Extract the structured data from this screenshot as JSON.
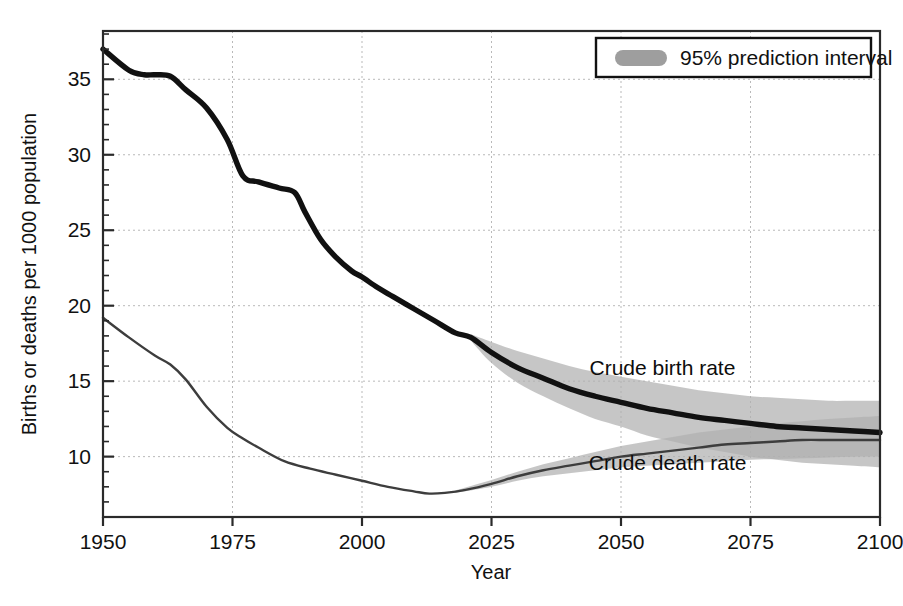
{
  "chart_data": {
    "type": "line",
    "title": "",
    "xlabel": "Year",
    "ylabel": "Births or deaths per 1000 population",
    "xlim": [
      1950,
      2100
    ],
    "ylim": [
      6.0,
      38.2
    ],
    "xticks": [
      1950,
      1975,
      2000,
      2025,
      2050,
      2075,
      2100
    ],
    "xtick_labels": [
      "1950",
      "1975",
      "2000",
      "2025",
      "2050",
      "2075",
      "2100"
    ],
    "yticks": [
      10,
      15,
      20,
      25,
      30,
      35
    ],
    "ytick_labels": [
      "10",
      "15",
      "20",
      "25",
      "30",
      "35"
    ],
    "minor_tick_step": 1,
    "grid": true,
    "grid_style": "dashed",
    "legend": {
      "position": "top-right",
      "entries": [
        {
          "label": "95% prediction interval",
          "swatch": "band",
          "color": "#9e9e9e"
        }
      ]
    },
    "annotations": [
      {
        "text": "Crude birth rate",
        "x": 2058,
        "y": 15.4
      },
      {
        "text": "Crude death rate",
        "x": 2059,
        "y": 9.1
      }
    ],
    "series": [
      {
        "name": "Crude birth rate",
        "style": "thick-black",
        "color": "#111111",
        "x": [
          1950,
          1955,
          1958,
          1960,
          1963,
          1966,
          1970,
          1974,
          1977,
          1980,
          1984,
          1987,
          1989,
          1992,
          1995,
          1998,
          2000,
          2003,
          2006,
          2010,
          2014,
          2018,
          2021,
          2025,
          2030,
          2035,
          2040,
          2045,
          2050,
          2055,
          2060,
          2065,
          2070,
          2075,
          2080,
          2085,
          2090,
          2095,
          2100
        ],
        "y": [
          37.0,
          35.6,
          35.3,
          35.3,
          35.2,
          34.3,
          33.1,
          31.0,
          28.6,
          28.2,
          27.8,
          27.5,
          26.2,
          24.4,
          23.2,
          22.3,
          21.9,
          21.2,
          20.6,
          19.8,
          19.0,
          18.2,
          17.9,
          16.9,
          15.9,
          15.2,
          14.5,
          14.0,
          13.6,
          13.2,
          12.9,
          12.6,
          12.4,
          12.2,
          12.0,
          11.9,
          11.8,
          11.7,
          11.6
        ]
      },
      {
        "name": "Crude death rate",
        "style": "thin-gray",
        "color": "#3d3d3d",
        "x": [
          1950,
          1955,
          1960,
          1963,
          1966,
          1970,
          1974,
          1977,
          1980,
          1985,
          1990,
          1995,
          2000,
          2005,
          2010,
          2013,
          2016,
          2020,
          2025,
          2030,
          2035,
          2040,
          2045,
          2050,
          2055,
          2060,
          2065,
          2070,
          2075,
          2080,
          2085,
          2090,
          2095,
          2100
        ],
        "y": [
          19.2,
          17.9,
          16.7,
          16.1,
          15.1,
          13.3,
          11.9,
          11.2,
          10.6,
          9.7,
          9.2,
          8.8,
          8.4,
          8.0,
          7.7,
          7.55,
          7.6,
          7.8,
          8.2,
          8.7,
          9.1,
          9.4,
          9.7,
          10.0,
          10.2,
          10.4,
          10.6,
          10.8,
          10.9,
          11.0,
          11.1,
          11.1,
          11.1,
          11.1
        ]
      }
    ],
    "prediction_intervals": [
      {
        "series": "Crude birth rate",
        "level": 95,
        "x": [
          2021,
          2025,
          2030,
          2035,
          2040,
          2045,
          2050,
          2055,
          2060,
          2065,
          2070,
          2075,
          2080,
          2085,
          2090,
          2095,
          2100
        ],
        "lower": [
          17.7,
          16.2,
          14.9,
          14.0,
          13.2,
          12.5,
          12.0,
          11.4,
          11.0,
          10.6,
          10.3,
          10.0,
          9.8,
          9.6,
          9.5,
          9.4,
          9.3
        ],
        "upper": [
          18.1,
          17.6,
          17.0,
          16.5,
          16.0,
          15.6,
          15.3,
          15.0,
          14.7,
          14.4,
          14.2,
          14.0,
          13.9,
          13.8,
          13.7,
          13.7,
          13.7
        ]
      },
      {
        "series": "Crude death rate",
        "level": 95,
        "x": [
          2018,
          2020,
          2025,
          2030,
          2035,
          2040,
          2045,
          2050,
          2055,
          2060,
          2065,
          2070,
          2075,
          2080,
          2085,
          2090,
          2095,
          2100
        ],
        "lower": [
          7.6,
          7.7,
          8.0,
          8.4,
          8.7,
          8.9,
          9.1,
          9.3,
          9.4,
          9.5,
          9.6,
          9.7,
          9.8,
          9.85,
          9.9,
          9.95,
          10.0,
          10.0
        ],
        "upper": [
          7.75,
          7.95,
          8.45,
          9.0,
          9.5,
          9.9,
          10.3,
          10.7,
          11.0,
          11.3,
          11.6,
          11.8,
          12.0,
          12.2,
          12.35,
          12.5,
          12.6,
          12.7
        ]
      }
    ]
  }
}
